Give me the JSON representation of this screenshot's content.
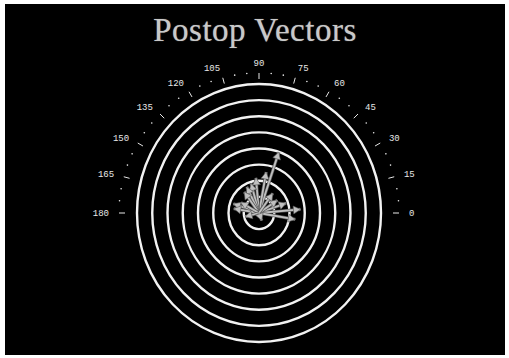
{
  "title": "Postop Vectors",
  "colors": {
    "background": "#000000",
    "rings": "#f2f2f2",
    "vectors": "#c0c0c0",
    "labels": "#e8e8e8",
    "title": "#c9c9c9"
  },
  "chart_data": {
    "type": "polar-vector",
    "title": "Postop Vectors",
    "angle_ticks": [
      0,
      15,
      30,
      45,
      60,
      75,
      90,
      105,
      120,
      135,
      150,
      165,
      180
    ],
    "angle_range": [
      0,
      180
    ],
    "ring_count": 8,
    "grid": true,
    "legend": null,
    "vectors": [
      {
        "angle": 72,
        "magnitude": 4.0
      },
      {
        "angle": 80,
        "magnitude": 2.6
      },
      {
        "angle": 95,
        "magnitude": 2.2
      },
      {
        "angle": 105,
        "magnitude": 1.9
      },
      {
        "angle": 115,
        "magnitude": 1.8
      },
      {
        "angle": 125,
        "magnitude": 1.6
      },
      {
        "angle": 160,
        "magnitude": 1.7
      },
      {
        "angle": 170,
        "magnitude": 1.6
      },
      {
        "angle": 150,
        "magnitude": 1.3
      },
      {
        "angle": 20,
        "magnitude": 1.8
      },
      {
        "angle": 5,
        "magnitude": 2.6
      },
      {
        "angle": 350,
        "magnitude": 2.3
      },
      {
        "angle": 35,
        "magnitude": 1.4
      },
      {
        "angle": 55,
        "magnitude": 1.5
      },
      {
        "angle": 195,
        "magnitude": 0.9
      },
      {
        "angle": 290,
        "magnitude": 0.5
      }
    ]
  },
  "axis_labels": [
    "0",
    "15",
    "30",
    "45",
    "60",
    "75",
    "90",
    "105",
    "120",
    "135",
    "150",
    "165",
    "180"
  ]
}
